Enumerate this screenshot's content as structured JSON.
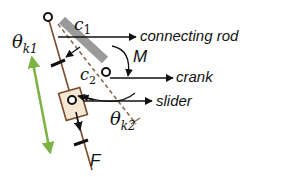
{
  "diagram": {
    "type": "mechanism-free-body",
    "labels": {
      "connecting_rod": "connecting rod",
      "crank": "crank",
      "slider": "slider",
      "moment": "M",
      "force": "F",
      "c1_base": "c",
      "c1_sub": "1",
      "c2_base": "c",
      "c2_sub": "2",
      "theta_k1_base": "θ",
      "theta_k1_sub": "k1",
      "theta_k2_base": "θ",
      "theta_k2_sub": "k2"
    },
    "colors": {
      "rod_brown": "#7a4a2a",
      "dashed_brown": "#8a6a4a",
      "gray_bar": "#9a9a9a",
      "slider_fill": "#f6e7d2",
      "slider_stroke": "#7a4a2a",
      "arrow_black": "#111111",
      "green_arrow": "#7cb342"
    }
  }
}
